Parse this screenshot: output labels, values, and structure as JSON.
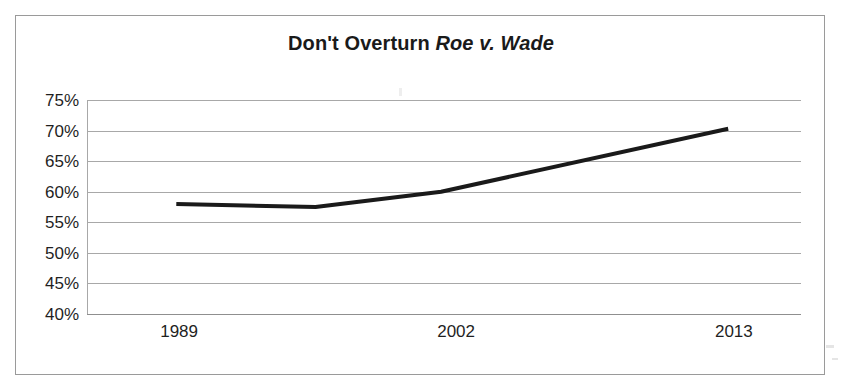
{
  "chart_data": {
    "type": "line",
    "title": "Don't Overturn Roe v. Wade",
    "title_plain": "Don't Overturn ",
    "title_emphasis": "Roe v. Wade",
    "categories": [
      "1989",
      "",
      "2002",
      "2013"
    ],
    "tick_labels": [
      "1989",
      "2002",
      "2013"
    ],
    "x": [
      1989,
      1995,
      2002,
      2013
    ],
    "values": [
      58,
      57.5,
      60,
      70.3
    ],
    "series": [
      {
        "name": "Don't Overturn Roe v. Wade",
        "values": [
          58,
          57.5,
          60,
          70.3
        ]
      }
    ],
    "xlabel": "",
    "ylabel": "",
    "ylim": [
      40,
      75
    ],
    "ytick_step": 5,
    "ytick_labels": [
      "75%",
      "70%",
      "65%",
      "60%",
      "55%",
      "50%",
      "45%",
      "40%"
    ],
    "ytick_values": [
      75,
      70,
      65,
      60,
      55,
      50,
      45,
      40
    ],
    "grid": true,
    "grid_axis": "y",
    "legend": false,
    "legend_position": "none",
    "value_format": "percent",
    "line_color": "#1a1a1a",
    "line_width": 4,
    "markers": false,
    "plot_background": "#ffffff",
    "grid_color": "#a8a8a8",
    "border_color": "#9a9a9a"
  },
  "colors": {
    "text": "#1f1f1f",
    "title": "#1a1a1a",
    "line": "#1a1a1a",
    "grid": "#a8a8a8",
    "frame": "#9a9a9a",
    "background": "#ffffff"
  }
}
